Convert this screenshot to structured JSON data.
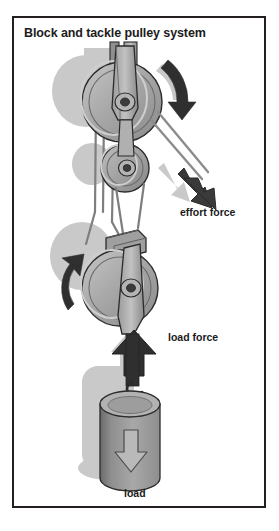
{
  "figure": {
    "title": "Block and tackle pulley system",
    "border_color": "#231f20",
    "background_color": "#ffffff"
  },
  "labels": {
    "effort_force": "effort force",
    "load_force": "load force",
    "load": "load"
  },
  "palette": {
    "ink": "#1b1b1b",
    "arrow_dark": "#3a3a3a",
    "shadow_light": "#c9c9c9",
    "metal_mid": "#a6a6a6",
    "metal_light": "#c0c0c0",
    "metal_dark": "#6e6e6e",
    "rope": "#8c8c8c",
    "load_body": "#9a9a9a",
    "load_dark": "#5e5e5e",
    "outline": "#2b2b2b"
  },
  "diagram": {
    "type": "block-and-tackle-pulley-system",
    "components": [
      {
        "name": "fixed-block",
        "role": "upper fixed block, attached to ceiling support",
        "pulleys": 2,
        "rotation": "clockwise"
      },
      {
        "name": "movable-block",
        "role": "lower movable block, carries the load",
        "pulleys": 1,
        "rotation": "counterclockwise"
      },
      {
        "name": "rope",
        "role": "rope threaded around the pulleys",
        "supporting_strands": 4
      },
      {
        "name": "load",
        "role": "cylindrical weight hanging from the movable block",
        "shape": "cylinder"
      }
    ],
    "forces": [
      {
        "name": "effort force",
        "direction": "down-right",
        "applied_at": "free end of rope",
        "arrow": "diagonal-down-right"
      },
      {
        "name": "load force",
        "direction": "up",
        "applied_at": "movable block hook",
        "arrow": "up"
      },
      {
        "name": "load weight",
        "direction": "down",
        "applied_at": "load cylinder",
        "arrow": "down"
      }
    ],
    "rotation_arrows": [
      {
        "name": "upper-pulley-rotation",
        "direction": "clockwise"
      },
      {
        "name": "lower-pulley-rotation",
        "direction": "counterclockwise"
      }
    ]
  }
}
